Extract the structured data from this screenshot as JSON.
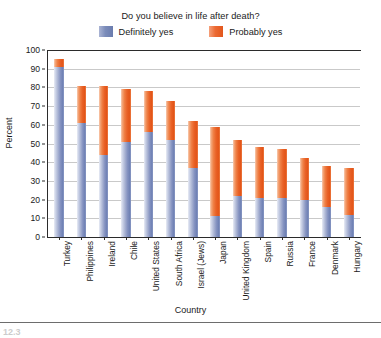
{
  "chart_data": {
    "type": "bar",
    "subtype": "stacked-column",
    "title": "Do you believe in life after death?",
    "xlabel": "Country",
    "ylabel": "Percent",
    "ylim": [
      0,
      100
    ],
    "ytick_step": 10,
    "grid": true,
    "legend_position": "top-center",
    "categories": [
      "Turkey",
      "Philippines",
      "Ireland",
      "Chile",
      "United States",
      "South Africa",
      "Israel (Jews)",
      "Japan",
      "United Kingdom",
      "Spain",
      "Russia",
      "France",
      "Denmark",
      "Hungary"
    ],
    "series": [
      {
        "name": "Definitely yes",
        "color": "#7b8cba",
        "values": [
          91,
          61,
          44,
          51,
          56,
          52,
          37,
          11,
          22,
          21,
          21,
          20,
          16,
          12
        ]
      },
      {
        "name": "Probably yes",
        "color": "#e9622a",
        "values": [
          4,
          20,
          37,
          28,
          22,
          21,
          25,
          48,
          30,
          27,
          26,
          22,
          22,
          25
        ]
      }
    ],
    "totals": [
      95,
      81,
      81,
      79,
      78,
      73,
      62,
      59,
      52,
      48,
      47,
      42,
      38,
      37
    ],
    "ytick_labels": [
      "0",
      "10",
      "20",
      "30",
      "40",
      "50",
      "60",
      "70",
      "80",
      "90",
      "100"
    ]
  },
  "footer": {
    "caption_fragment": "12.3"
  }
}
